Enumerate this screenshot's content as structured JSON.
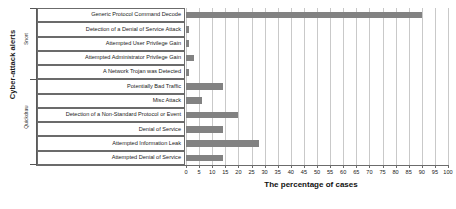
{
  "chart_data": {
    "type": "bar",
    "orientation": "horizontal",
    "title": "",
    "xlabel": "The percentage of cases",
    "ylabel": "Cyber-attack alerts",
    "xlim": [
      0,
      100
    ],
    "xticks": [
      0,
      5,
      10,
      15,
      20,
      25,
      30,
      35,
      40,
      45,
      50,
      55,
      60,
      65,
      70,
      75,
      80,
      85,
      90,
      95,
      100
    ],
    "grid": true,
    "legend": "none",
    "bar_color": "#828282",
    "groups": [
      {
        "label": "Snort",
        "categories": [
          "Generic Protocol Command Decode",
          "Detection of a Denial of Service Attack",
          "Attempted User Privilege Gain",
          "Attempted Administrator Privilege Gain",
          "A Network Trojan was Detected"
        ]
      },
      {
        "label": "Quickdraw",
        "categories": [
          "Potentially Bad Traffic",
          "Misc Attack",
          "Detection of a Non-Standard Protocol or Event",
          "Denial of Service",
          "Attempted Information Leak",
          "Attempted Denial of Service"
        ]
      }
    ],
    "categories": [
      "Generic Protocol Command Decode",
      "Detection of a Denial of Service Attack",
      "Attempted User Privilege Gain",
      "Attempted Administrator Privilege Gain",
      "A Network Trojan was Detected",
      "Potentially Bad Traffic",
      "Misc Attack",
      "Detection of a Non-Standard Protocol or Event",
      "Denial of Service",
      "Attempted Information Leak",
      "Attempted Denial of Service"
    ],
    "values": [
      90,
      1,
      1,
      3,
      1,
      14,
      6,
      20,
      14,
      28,
      14
    ]
  }
}
